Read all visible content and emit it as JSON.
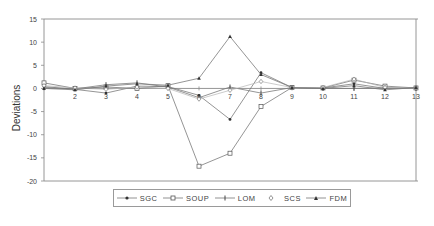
{
  "chart_data": {
    "type": "line",
    "title": "",
    "xlabel": "",
    "ylabel": "Deviations",
    "ylim": [
      -20,
      15
    ],
    "yticks": [
      15,
      10,
      5,
      0,
      -5,
      -10,
      -15,
      -20
    ],
    "x": [
      1,
      2,
      3,
      4,
      5,
      6,
      7,
      8,
      9,
      10,
      11,
      12,
      13
    ],
    "xtick_labels": [
      "",
      "2",
      "3",
      "4",
      "5",
      "6",
      "7",
      "8",
      "9",
      "10",
      "11",
      "12",
      "13"
    ],
    "grid": false,
    "legend_position": "bottom",
    "series": [
      {
        "name": "SGC",
        "marker": "filled-circle",
        "values": [
          0.4,
          -0.2,
          -1.0,
          0.5,
          0.4,
          -1.5,
          -6.7,
          3.4,
          0.2,
          0.1,
          1.0,
          0.0,
          0.2
        ]
      },
      {
        "name": "SOUP",
        "marker": "open-square",
        "values": [
          1.2,
          0.0,
          0.3,
          0.0,
          0.6,
          -16.8,
          -14.0,
          -3.9,
          0.2,
          0.1,
          1.8,
          0.5,
          0.1
        ]
      },
      {
        "name": "LOM",
        "marker": "plus",
        "values": [
          0.2,
          -0.1,
          0.8,
          1.2,
          0.3,
          -2.0,
          0.3,
          -1.0,
          0.2,
          0.0,
          0.0,
          0.1,
          0.0
        ]
      },
      {
        "name": "SCS",
        "marker": "open-diamond",
        "values": [
          0.6,
          0.1,
          -0.2,
          0.3,
          0.0,
          -2.3,
          -0.4,
          1.5,
          0.2,
          0.2,
          2.0,
          0.2,
          0.1
        ]
      },
      {
        "name": "FDM",
        "marker": "filled-triangle",
        "values": [
          0.0,
          -0.3,
          0.5,
          1.0,
          0.7,
          2.2,
          11.2,
          3.0,
          0.2,
          0.0,
          0.6,
          -0.3,
          0.2
        ]
      }
    ]
  },
  "legend": {
    "items": [
      "SGC",
      "SOUP",
      "LOM",
      "SCS",
      "FDM"
    ]
  },
  "colors": {
    "axis": "#8a8a8a",
    "line": "#7a7a7a",
    "marker": "#333333",
    "text": "#444444"
  }
}
